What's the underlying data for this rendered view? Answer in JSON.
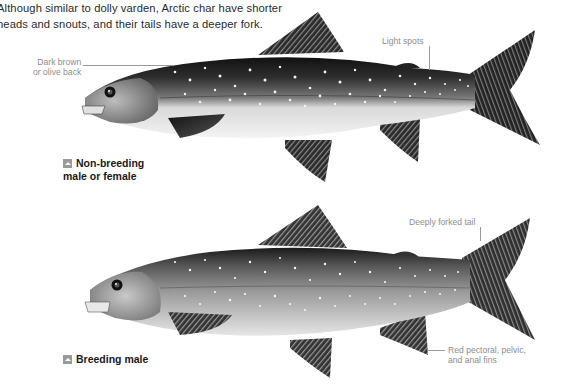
{
  "intro": {
    "line1": "Although similar to dolly varden, Arctic char have shorter",
    "line2": "heads and snouts, and their tails have a deeper fork."
  },
  "fish_top": {
    "label_line1": "Non-breeding",
    "label_line2": "male or female",
    "icon": "triangle-up-icon",
    "callouts": {
      "back_line1": "Dark brown",
      "back_line2": "or olive back",
      "spots": "Light spots"
    }
  },
  "fish_bottom": {
    "label": "Breeding male",
    "icon": "triangle-up-icon",
    "callouts": {
      "tail": "Deeply forked tail",
      "fins_line1": "Red pectoral, pelvic,",
      "fins_line2": "and anal fins"
    }
  },
  "colors": {
    "background": "#ffffff",
    "text": "#2a2a2a",
    "callout_text": "#8e8e8e",
    "fish_dark": "#1e1e1e",
    "fish_mid": "#6e6e6e",
    "fish_belly": "#f2f2f2"
  }
}
